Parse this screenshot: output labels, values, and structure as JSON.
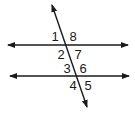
{
  "diagram": {
    "type": "parallel-lines-cut-by-transversal",
    "stroke_color": "#1a1a1a",
    "parallel_lines": [
      {
        "name": "upper-line",
        "x1": 8,
        "y1": 45,
        "x2": 128,
        "y2": 45
      },
      {
        "name": "lower-line",
        "x1": 10,
        "y1": 76,
        "x2": 129,
        "y2": 76
      }
    ],
    "transversal": {
      "x1": 52,
      "y1": 5,
      "x2": 87,
      "y2": 107
    },
    "angles": [
      {
        "label": "1",
        "x": 55,
        "y": 36
      },
      {
        "label": "8",
        "x": 73,
        "y": 36
      },
      {
        "label": "2",
        "x": 61,
        "y": 54
      },
      {
        "label": "7",
        "x": 78,
        "y": 54
      },
      {
        "label": "3",
        "x": 67,
        "y": 68
      },
      {
        "label": "6",
        "x": 83,
        "y": 68
      },
      {
        "label": "4",
        "x": 73,
        "y": 85
      },
      {
        "label": "5",
        "x": 88,
        "y": 85
      }
    ]
  }
}
